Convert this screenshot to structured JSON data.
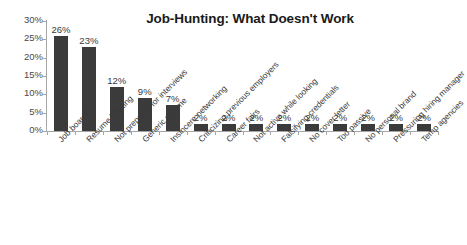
{
  "chart_data": {
    "type": "bar",
    "title": "Job-Hunting: What Doesn't Work",
    "xlabel": "",
    "ylabel": "",
    "ylim": [
      0,
      30
    ],
    "grid": false,
    "legend": "none",
    "y_unit": "%",
    "y_ticks": [
      "0%",
      "5%",
      "10%",
      "15%",
      "20%",
      "25%",
      "30%"
    ],
    "y_tick_values": [
      0,
      5,
      10,
      15,
      20,
      25,
      30
    ],
    "categories": [
      "Job boards",
      "Resume blasting",
      "Not prepared for interviews",
      "Generic resume",
      "Insincere networking",
      "Criticizing previous employers",
      "Career fairs",
      "Not active while looking",
      "Falsifying credentials",
      "No cover letter",
      "Too passive",
      "No personal brand",
      "Pressuring hiring manager",
      "Temp agencies"
    ],
    "values": [
      26,
      23,
      12,
      9,
      7,
      2,
      2,
      2,
      2,
      2,
      2,
      2,
      2,
      2
    ],
    "data_labels": [
      "26%",
      "23%",
      "12%",
      "9%",
      "7%",
      "2%",
      "2%",
      "2%",
      "2%",
      "2%",
      "2%",
      "2%",
      "2%",
      "2%"
    ],
    "bar_color": "#3b3b3b",
    "axis_color": "#a6a6a6",
    "background_color": "#ffffff",
    "text_color": "#3a3a3a"
  }
}
